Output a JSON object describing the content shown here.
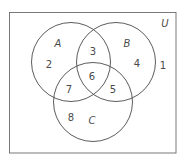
{
  "diagram": {
    "type": "venn",
    "universe": {
      "label": "U",
      "x": 9.5,
      "y": 12.5,
      "width": 166.5,
      "height": 140.5
    },
    "sets": [
      {
        "id": "A",
        "label": "A",
        "cx": 71,
        "cy": 62,
        "r": 39.5,
        "label_pos": [
          58,
          47
        ]
      },
      {
        "id": "B",
        "label": "B",
        "cx": 116,
        "cy": 62,
        "r": 39.5,
        "label_pos": [
          127,
          47
        ]
      },
      {
        "id": "C",
        "label": "C",
        "cx": 93,
        "cy": 102,
        "r": 39.5,
        "label_pos": [
          92,
          124
        ]
      }
    ],
    "regions": [
      {
        "value": "1",
        "description": "outside A, B, C",
        "pos": [
          163,
          69
        ]
      },
      {
        "value": "2",
        "description": "A only",
        "pos": [
          49,
          68
        ]
      },
      {
        "value": "3",
        "description": "A and B only",
        "pos": [
          93,
          55
        ]
      },
      {
        "value": "4",
        "description": "B only",
        "pos": [
          137,
          67
        ]
      },
      {
        "value": "5",
        "description": "B and C only",
        "pos": [
          113,
          93
        ]
      },
      {
        "value": "6",
        "description": "A and B and C",
        "pos": [
          92,
          80
        ]
      },
      {
        "value": "7",
        "description": "A and C only",
        "pos": [
          69,
          93
        ]
      },
      {
        "value": "8",
        "description": "C only",
        "pos": [
          71,
          121
        ]
      }
    ],
    "universe_label_pos": [
      165,
      27
    ]
  }
}
